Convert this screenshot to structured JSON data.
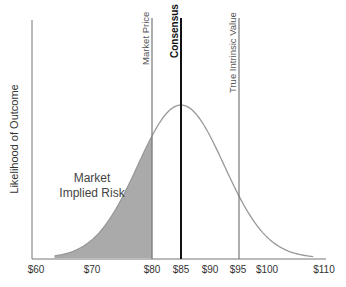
{
  "chart_data": {
    "type": "area",
    "title": "",
    "xlabel": "",
    "ylabel": "Likelihood of Outcome",
    "x_ticks": [
      "$60",
      "$70",
      "$80",
      "$85",
      "$90",
      "$95",
      "$100",
      "$110"
    ],
    "x_tick_values": [
      60,
      70,
      80,
      85,
      90,
      95,
      100,
      110
    ],
    "xlim": [
      59,
      111
    ],
    "distribution": {
      "type": "normal",
      "mean": 85,
      "sd": 7.5,
      "peak_relative_height": 0.78
    },
    "shaded_region": {
      "from": 61,
      "to": 80,
      "label": "Market Implied Risk",
      "color": "#aaaaaa"
    },
    "vertical_lines": [
      {
        "label": "Market Price",
        "x": 80,
        "style": "thin",
        "color": "#777777"
      },
      {
        "label": "Consensus",
        "x": 85,
        "style": "thick",
        "color": "#111111"
      },
      {
        "label": "True Intrinsic Value",
        "x": 95,
        "style": "thin",
        "color": "#777777"
      }
    ],
    "annotations": [
      {
        "text_lines": [
          "Market",
          "Implied Risk"
        ],
        "x": 72,
        "position": "left-of-curve"
      }
    ],
    "grid": false,
    "legend": null
  },
  "labels": {
    "ylabel": "Likelihood of Outcome",
    "market_price": "Market Price",
    "consensus": "Consensus",
    "true_value": "True Intrinsic Value",
    "annotation_line1": "Market",
    "annotation_line2": "Implied Risk",
    "ticks": [
      "$60",
      "$70",
      "$80",
      "$85",
      "$90",
      "$95",
      "$100",
      "$110"
    ]
  },
  "colors": {
    "curve": "#999999",
    "fill": "#aaaaaa",
    "axis": "#777777",
    "consensus": "#111111"
  }
}
